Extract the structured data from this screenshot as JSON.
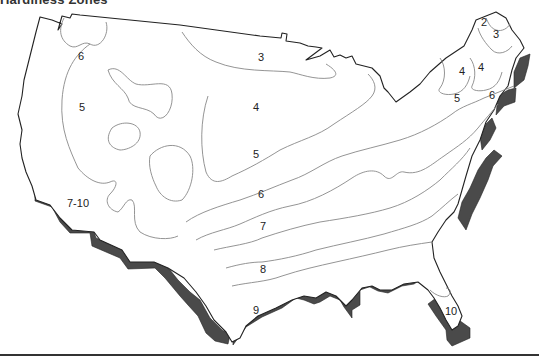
{
  "title": "Hardiness Zones",
  "map": {
    "region": "Contiguous United States",
    "colors": {
      "land": "#ffffff",
      "coast_shadow": "#4a4a4a",
      "outline": "#222222",
      "contour": "#888888"
    },
    "zone_labels": [
      {
        "id": "z2-ne",
        "text": "2",
        "x": 484,
        "y": 26
      },
      {
        "id": "z3-ne",
        "text": "3",
        "x": 496,
        "y": 38
      },
      {
        "id": "z4-ne-a",
        "text": "4",
        "x": 462,
        "y": 75
      },
      {
        "id": "z4-ne-b",
        "text": "4",
        "x": 481,
        "y": 71
      },
      {
        "id": "z5-ne",
        "text": "5",
        "x": 457,
        "y": 102
      },
      {
        "id": "z6-ne",
        "text": "6",
        "x": 492,
        "y": 99
      },
      {
        "id": "z6-nw",
        "text": "6",
        "x": 81,
        "y": 60
      },
      {
        "id": "z5-w",
        "text": "5",
        "x": 82,
        "y": 111
      },
      {
        "id": "z3-n",
        "text": "3",
        "x": 261,
        "y": 61
      },
      {
        "id": "z4-c",
        "text": "4",
        "x": 256,
        "y": 111
      },
      {
        "id": "z5-c",
        "text": "5",
        "x": 256,
        "y": 158
      },
      {
        "id": "z6-c",
        "text": "6",
        "x": 261,
        "y": 198
      },
      {
        "id": "z7-c",
        "text": "7",
        "x": 263,
        "y": 230
      },
      {
        "id": "z7-10-sw",
        "text": "7-10",
        "x": 78,
        "y": 207
      },
      {
        "id": "z8-s",
        "text": "8",
        "x": 263,
        "y": 273
      },
      {
        "id": "z9-s",
        "text": "9",
        "x": 256,
        "y": 314
      },
      {
        "id": "z10-fl",
        "text": "10",
        "x": 451,
        "y": 315
      }
    ]
  }
}
